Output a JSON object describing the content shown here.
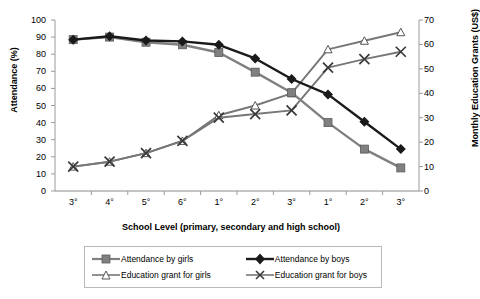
{
  "chart_data": {
    "type": "line",
    "title": "",
    "xlabel": "School Level (primary, secondary and high school)",
    "ylabel": "Attendance (%)",
    "y2label": "Monthly Education Grants (US$)",
    "categories": [
      "3°",
      "4°",
      "5°",
      "6°",
      "1°",
      "2°",
      "3°",
      "1°",
      "2°",
      "3°"
    ],
    "ylim": [
      0,
      100
    ],
    "yticks": [
      0,
      10,
      20,
      30,
      40,
      50,
      60,
      70,
      80,
      90,
      100
    ],
    "y2lim": [
      0,
      70
    ],
    "y2ticks": [
      0,
      10,
      20,
      30,
      40,
      50,
      60,
      70
    ],
    "grid": false,
    "legend_position": "bottom",
    "series": [
      {
        "name": "Attendance by girls",
        "axis": "left",
        "marker": "filled-square",
        "color": "#808080",
        "values": [
          88.5,
          90,
          87,
          85.5,
          81,
          69.5,
          57.5,
          40,
          24.5,
          13.5
        ]
      },
      {
        "name": "Attendance by boys",
        "axis": "left",
        "marker": "filled-diamond",
        "color": "#1a1a1a",
        "values": [
          88.5,
          90.5,
          88,
          87.5,
          85.5,
          77.5,
          65.5,
          56.5,
          40.5,
          24.5
        ]
      },
      {
        "name": "Education grant for girls",
        "axis": "right",
        "marker": "open-triangle",
        "color": "#777777",
        "values": [
          10,
          12,
          15.5,
          20.5,
          31,
          35,
          40,
          58,
          61.5,
          65
        ]
      },
      {
        "name": "Education grant for boys",
        "axis": "right",
        "marker": "cross-x",
        "color": "#777777",
        "values": [
          10,
          12,
          15.5,
          20.5,
          30,
          31.5,
          33,
          50.5,
          54,
          57
        ]
      }
    ]
  },
  "legend": {
    "items": [
      {
        "label": "Attendance by girls",
        "key": "legend-key-attendance-girls"
      },
      {
        "label": "Attendance by boys",
        "key": "legend-key-attendance-boys"
      },
      {
        "label": "Education grant for girls",
        "key": "legend-key-grant-girls"
      },
      {
        "label": "Education grant for boys",
        "key": "legend-key-grant-boys"
      }
    ]
  }
}
